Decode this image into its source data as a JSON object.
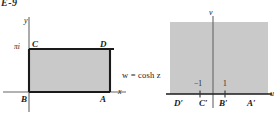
{
  "figure": {
    "plate_id": "E-9",
    "mapping_label": "w = cosh z",
    "fill_color": "#c9c9c9",
    "line_color": "#1a1a1a",
    "axis_color": "#555555",
    "background": "#ffffff"
  },
  "z_plane": {
    "axes": {
      "x_label": "x",
      "y_label": "y"
    },
    "ticks": [
      {
        "label": "πi",
        "axis": "y"
      }
    ],
    "vertices": [
      {
        "label": "B",
        "position": "bottom-left"
      },
      {
        "label": "A",
        "position": "bottom-right"
      },
      {
        "label": "D",
        "position": "top-right"
      },
      {
        "label": "C",
        "position": "top-left"
      }
    ]
  },
  "w_plane": {
    "axes": {
      "u_label": "u",
      "v_label": "v"
    },
    "ticks": [
      {
        "label": "−1",
        "value": -1
      },
      {
        "label": "1",
        "value": 1
      }
    ],
    "image_points": [
      {
        "label": "D′"
      },
      {
        "label": "C′"
      },
      {
        "label": "B′"
      },
      {
        "label": "A′"
      }
    ]
  }
}
